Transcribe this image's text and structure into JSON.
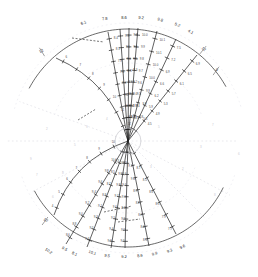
{
  "figure": {
    "type": "polar-ray-nomogram",
    "background_color": "#ffffff",
    "ink_color": "#1c1c1c",
    "ghost_color": "#e3e3e8",
    "center": {
      "x": 128,
      "y": 141,
      "radius_px": 13
    }
  },
  "chart_data": {
    "type": "line",
    "title": "",
    "subtitle": "",
    "xlabel": "",
    "ylabel": "",
    "grid": false,
    "legend_position": "none",
    "projection": "polar-converging-rays",
    "center_point": {
      "x": 128,
      "y": 141
    },
    "top_arc": {
      "label_row_1": [
        "6.1",
        "7.8",
        "8.6",
        "9.2",
        "9.8",
        "5.2",
        "4.1"
      ],
      "label_row_1_positions": [
        {
          "x": 84,
          "y": 24
        },
        {
          "x": 105,
          "y": 20
        },
        {
          "x": 124,
          "y": 19
        },
        {
          "x": 141,
          "y": 19
        },
        {
          "x": 160,
          "y": 21
        },
        {
          "x": 177,
          "y": 26
        },
        {
          "x": 190,
          "y": 33
        }
      ],
      "arc_from": {
        "x": 74,
        "y": 33
      },
      "arc_to": {
        "x": 196,
        "y": 37
      }
    },
    "bottom_arc": {
      "label_row_1": [
        "10.2",
        "9.5",
        "8.1",
        "10.1",
        "9.5",
        "9.2",
        "8.9",
        "9.9",
        "9.3",
        "9.6"
      ],
      "label_row_1_positions": [
        {
          "x": 48,
          "y": 252
        },
        {
          "x": 64,
          "y": 250
        },
        {
          "x": 74,
          "y": 255
        },
        {
          "x": 92,
          "y": 254
        },
        {
          "x": 107,
          "y": 257
        },
        {
          "x": 124,
          "y": 258
        },
        {
          "x": 140,
          "y": 257
        },
        {
          "x": 155,
          "y": 255
        },
        {
          "x": 170,
          "y": 252
        },
        {
          "x": 183,
          "y": 248
        }
      ],
      "arc_from": {
        "x": 44,
        "y": 245
      },
      "arc_to": {
        "x": 192,
        "y": 241
      }
    },
    "edge_labels": [
      {
        "text": "12",
        "x": 42,
        "y": 52,
        "rotation": -32,
        "name": "upper-left-end-label"
      },
      {
        "text": "12",
        "x": 203,
        "y": 50,
        "rotation": 38,
        "name": "upper-right-end-label"
      },
      {
        "text": "9",
        "x": 216,
        "y": 71,
        "rotation": 35,
        "name": "right-end-label"
      },
      {
        "text": "10",
        "x": 45,
        "y": 221,
        "rotation": 36,
        "name": "lower-left-end-label"
      }
    ],
    "rays": [
      {
        "name": "ray-upper-1",
        "angle_deg": -118,
        "end": {
          "x": 108,
          "y": 32
        },
        "tick_count": 9,
        "values": [
          "6.1",
          "6.4",
          "6.8",
          "7.0",
          "7.3",
          "7.6",
          "7.9",
          "8.1",
          "8.4"
        ]
      },
      {
        "name": "ray-upper-2",
        "angle_deg": -109,
        "end": {
          "x": 120,
          "y": 29
        },
        "tick_count": 9,
        "values": [
          "7.8",
          "8.0",
          "8.2",
          "8.4",
          "8.6",
          "8.8",
          "9.0",
          "9.1",
          "9.3"
        ]
      },
      {
        "name": "ray-upper-3",
        "angle_deg": -101,
        "end": {
          "x": 129,
          "y": 28
        },
        "tick_count": 9,
        "values": [
          "8.6",
          "8.7",
          "8.9",
          "9.0",
          "9.2",
          "9.3",
          "9.5",
          "9.6",
          "9.8"
        ]
      },
      {
        "name": "ray-upper-4",
        "angle_deg": -94,
        "end": {
          "x": 138,
          "y": 28
        },
        "tick_count": 9,
        "values": [
          "9.2",
          "9.3",
          "9.4",
          "9.5",
          "9.6",
          "9.7",
          "9.8",
          "9.9",
          "10.0"
        ]
      },
      {
        "name": "ray-upper-5",
        "angle_deg": -80,
        "end": {
          "x": 157,
          "y": 31
        },
        "tick_count": 8,
        "values": [
          "9.8",
          "9.8",
          "9.9",
          "9.9",
          "10.0",
          "10.0",
          "10.1",
          "10.1"
        ]
      },
      {
        "name": "ray-upper-6",
        "angle_deg": -66,
        "end": {
          "x": 176,
          "y": 39
        },
        "tick_count": 8,
        "values": [
          "5.2",
          "5.5",
          "5.9",
          "6.2",
          "6.6",
          "6.9",
          "7.2",
          "7.5"
        ]
      },
      {
        "name": "ray-upper-7",
        "angle_deg": -52,
        "end": {
          "x": 197,
          "y": 55
        },
        "tick_count": 8,
        "values": [
          "4.1",
          "4.5",
          "4.9",
          "5.3",
          "5.7",
          "6.1",
          "6.5",
          "6.9"
        ]
      },
      {
        "name": "ray-upper-8-curved",
        "angle_deg": -146,
        "end": {
          "x": 56,
          "y": 58
        },
        "tick_count": 7,
        "values": [
          "12",
          "11",
          "10",
          "9",
          "8",
          "7",
          "6"
        ]
      },
      {
        "name": "ray-lower-1",
        "angle_deg": 118,
        "end": {
          "x": 66,
          "y": 244
        },
        "tick_count": 9,
        "values": [
          "10.2",
          "10.0",
          "9.8",
          "9.6",
          "9.4",
          "9.2",
          "9.0",
          "8.8",
          "8.6"
        ]
      },
      {
        "name": "ray-lower-2",
        "angle_deg": 104,
        "end": {
          "x": 87,
          "y": 247
        },
        "tick_count": 9,
        "values": [
          "8.1",
          "8.3",
          "8.5",
          "8.7",
          "8.9",
          "9.1",
          "9.3",
          "9.5",
          "9.7"
        ]
      },
      {
        "name": "ray-lower-3",
        "angle_deg": 95,
        "end": {
          "x": 111,
          "y": 248
        },
        "tick_count": 9,
        "values": [
          "10.1",
          "10.0",
          "9.9",
          "9.8",
          "9.7",
          "9.6",
          "9.5",
          "9.4",
          "9.3"
        ]
      },
      {
        "name": "ray-lower-4",
        "angle_deg": 88,
        "end": {
          "x": 125,
          "y": 248
        },
        "tick_count": 9,
        "values": [
          "9.5",
          "9.5",
          "9.4",
          "9.4",
          "9.3",
          "9.3",
          "9.2",
          "9.2",
          "9.1"
        ]
      },
      {
        "name": "ray-lower-5",
        "angle_deg": 78,
        "end": {
          "x": 149,
          "y": 246
        },
        "tick_count": 8,
        "values": [
          "9.2",
          "9.1",
          "9.0",
          "8.9",
          "8.8",
          "8.7",
          "8.6",
          "8.5"
        ]
      },
      {
        "name": "ray-lower-6",
        "angle_deg": 62,
        "end": {
          "x": 176,
          "y": 234
        },
        "tick_count": 7,
        "values": [
          "8.9",
          "8.7",
          "8.5",
          "8.3",
          "8.1",
          "7.9",
          "7.7"
        ]
      },
      {
        "name": "ray-lower-7-curved",
        "angle_deg": 140,
        "end": {
          "x": 54,
          "y": 215
        },
        "tick_count": 7,
        "values": [
          "10",
          "9",
          "8",
          "7",
          "6",
          "5",
          "4"
        ]
      }
    ],
    "ghost_rays": [
      {
        "name": "ghost-ray-right-horizontal",
        "angle_deg": 0,
        "length": 110
      },
      {
        "name": "ghost-ray-left-horizontal",
        "angle_deg": 180,
        "length": 120
      },
      {
        "name": "ghost-ray-lower-right",
        "angle_deg": 28,
        "length": 115
      },
      {
        "name": "ghost-ray-lower-right-2",
        "angle_deg": 45,
        "length": 110
      },
      {
        "name": "ghost-ray-upper-left",
        "angle_deg": 200,
        "length": 115
      },
      {
        "name": "ghost-ray-lower-left",
        "angle_deg": 152,
        "length": 110
      }
    ]
  }
}
